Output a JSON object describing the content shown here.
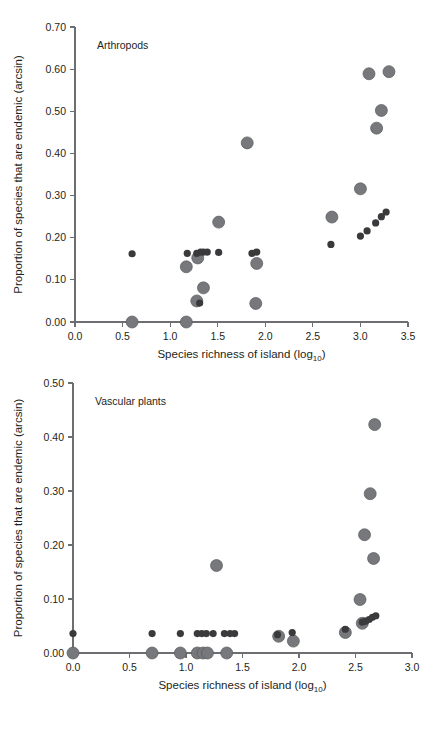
{
  "figure": {
    "width": 441,
    "height": 730,
    "background": "#ffffff",
    "marker_colors": {
      "large_gray_fill": "#77787b",
      "large_gray_stroke": "#58595b",
      "small_dark_fill": "#3a3a3c",
      "axis": "#6d6e71",
      "text": "#231f20"
    }
  },
  "chart_data": [
    {
      "type": "scatter",
      "title": "Arthropods",
      "panel_label": "Arthropods",
      "xlabel": "Species richness of island (log10)",
      "xlabel_base": "Species richness of island (log",
      "xlabel_sub": "10",
      "xlabel_tail": ")",
      "ylabel": "Proportion of species that are endemic (arcsin)",
      "xlim": [
        0.0,
        3.5
      ],
      "ylim": [
        0.0,
        0.7
      ],
      "xticks": [
        0.0,
        0.5,
        1.0,
        1.5,
        2.0,
        2.5,
        3.0,
        3.5
      ],
      "xticklabels": [
        "0.0",
        "0.5",
        "1.0",
        "1.5",
        "2.0",
        "2.5",
        "3.0",
        "3.5"
      ],
      "yticks": [
        0.0,
        0.1,
        0.2,
        0.3,
        0.4,
        0.5,
        0.6,
        0.7
      ],
      "yticklabels": [
        "0.00",
        "0.10",
        "0.20",
        "0.30",
        "0.40",
        "0.50",
        "0.60",
        "0.70"
      ],
      "grid": false,
      "legend": null,
      "series": [
        {
          "name": "large-markers",
          "marker": "large-gray-circle",
          "points": [
            [
              0.6,
              0.0
            ],
            [
              1.17,
              0.0
            ],
            [
              1.17,
              0.131
            ],
            [
              1.28,
              0.05
            ],
            [
              1.29,
              0.152
            ],
            [
              1.35,
              0.081
            ],
            [
              1.51,
              0.237
            ],
            [
              1.81,
              0.425
            ],
            [
              1.9,
              0.044
            ],
            [
              1.91,
              0.139
            ],
            [
              2.7,
              0.249
            ],
            [
              3.0,
              0.316
            ],
            [
              3.09,
              0.589
            ],
            [
              3.17,
              0.46
            ],
            [
              3.22,
              0.502
            ],
            [
              3.3,
              0.594
            ]
          ]
        },
        {
          "name": "small-markers",
          "marker": "small-dark-circle",
          "points": [
            [
              0.6,
              0.162
            ],
            [
              1.18,
              0.163
            ],
            [
              1.28,
              0.163
            ],
            [
              1.31,
              0.045
            ],
            [
              1.32,
              0.166
            ],
            [
              1.35,
              0.166
            ],
            [
              1.39,
              0.166
            ],
            [
              1.51,
              0.165
            ],
            [
              1.86,
              0.163
            ],
            [
              1.91,
              0.166
            ],
            [
              2.69,
              0.184
            ],
            [
              3.0,
              0.204
            ],
            [
              3.07,
              0.216
            ],
            [
              3.16,
              0.235
            ],
            [
              3.22,
              0.25
            ],
            [
              3.27,
              0.261
            ]
          ]
        }
      ]
    },
    {
      "type": "scatter",
      "title": "Vascular plants",
      "panel_label": "Vascular plants",
      "xlabel": "Species richness of island (log10)",
      "xlabel_base": "Species richness of island (log",
      "xlabel_sub": "10",
      "xlabel_tail": ")",
      "ylabel": "Proportion of species that are endemic (arcsin)",
      "xlim": [
        0.0,
        3.0
      ],
      "ylim": [
        0.0,
        0.5
      ],
      "xticks": [
        0.0,
        0.5,
        1.0,
        1.5,
        2.0,
        2.5,
        3.0
      ],
      "xticklabels": [
        "0.0",
        "0.5",
        "1.0",
        "1.5",
        "2.0",
        "2.5",
        "3.0"
      ],
      "yticks": [
        0.0,
        0.1,
        0.2,
        0.3,
        0.4,
        0.5
      ],
      "yticklabels": [
        "0.00",
        "0.10",
        "0.20",
        "0.30",
        "0.40",
        "0.50"
      ],
      "grid": false,
      "legend": null,
      "series": [
        {
          "name": "large-markers",
          "marker": "large-gray-circle",
          "points": [
            [
              0.0,
              0.0
            ],
            [
              0.7,
              0.0
            ],
            [
              0.95,
              0.0
            ],
            [
              1.1,
              0.0
            ],
            [
              1.15,
              0.0
            ],
            [
              1.19,
              0.0
            ],
            [
              1.36,
              0.0
            ],
            [
              1.27,
              0.162
            ],
            [
              1.82,
              0.031
            ],
            [
              1.95,
              0.022
            ],
            [
              2.41,
              0.038
            ],
            [
              2.54,
              0.099
            ],
            [
              2.56,
              0.055
            ],
            [
              2.58,
              0.219
            ],
            [
              2.63,
              0.295
            ],
            [
              2.66,
              0.175
            ],
            [
              2.67,
              0.423
            ]
          ]
        },
        {
          "name": "small-markers",
          "marker": "small-dark-circle",
          "points": [
            [
              0.0,
              0.036
            ],
            [
              0.7,
              0.036
            ],
            [
              0.95,
              0.036
            ],
            [
              1.1,
              0.036
            ],
            [
              1.14,
              0.036
            ],
            [
              1.18,
              0.036
            ],
            [
              1.24,
              0.036
            ],
            [
              1.34,
              0.036
            ],
            [
              1.39,
              0.036
            ],
            [
              1.43,
              0.036
            ],
            [
              1.81,
              0.034
            ],
            [
              1.94,
              0.038
            ],
            [
              2.41,
              0.044
            ],
            [
              2.56,
              0.057
            ],
            [
              2.59,
              0.059
            ],
            [
              2.62,
              0.062
            ],
            [
              2.65,
              0.066
            ],
            [
              2.68,
              0.069
            ]
          ]
        }
      ]
    }
  ]
}
